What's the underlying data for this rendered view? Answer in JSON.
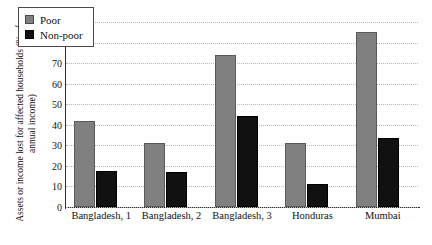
{
  "chart_data": {
    "type": "bar",
    "title": "",
    "xlabel": "",
    "ylabel": "Assets or income lost for affected households (% of annual income)",
    "ylim": [
      0,
      90
    ],
    "yticks": [
      0,
      10,
      20,
      30,
      40,
      50,
      60,
      70,
      80,
      90
    ],
    "grid": true,
    "legend_position": "upper-left-inside",
    "categories": [
      "Bangladesh, 1",
      "Bangladesh, 2",
      "Bangladesh, 3",
      "Honduras",
      "Mumbai"
    ],
    "series": [
      {
        "name": "Poor",
        "color": "#808080",
        "values": [
          42,
          31,
          74,
          31,
          85
        ]
      },
      {
        "name": "Non-poor",
        "color": "#111111",
        "values": [
          17.5,
          17,
          44.5,
          11,
          33.5
        ]
      }
    ]
  }
}
